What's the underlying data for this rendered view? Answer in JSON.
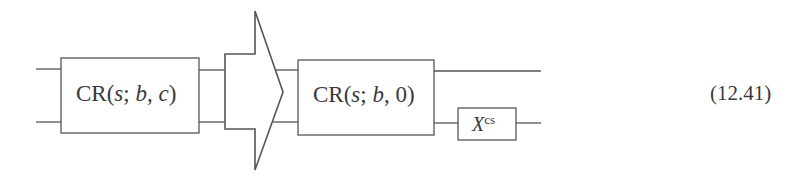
{
  "diagram": {
    "left_gate": {
      "name": "CR",
      "open": "(",
      "arg1": "s",
      "sep1": "; ",
      "arg2": "b",
      "sep2": ", ",
      "arg3": "c",
      "close": ")"
    },
    "arrow": {
      "direction": "right",
      "meaning": "equivalent-to"
    },
    "right_gate": {
      "name": "CR",
      "open": "(",
      "arg1": "s",
      "sep1": "; ",
      "arg2": "b",
      "sep2": ", ",
      "arg3": "0",
      "close": ")"
    },
    "x_gate": {
      "base": "X",
      "superscript": "cs"
    },
    "equation_number": "(12.41)",
    "colors": {
      "stroke": "#555555",
      "text": "#3a3a3a",
      "background": "#ffffff"
    }
  }
}
